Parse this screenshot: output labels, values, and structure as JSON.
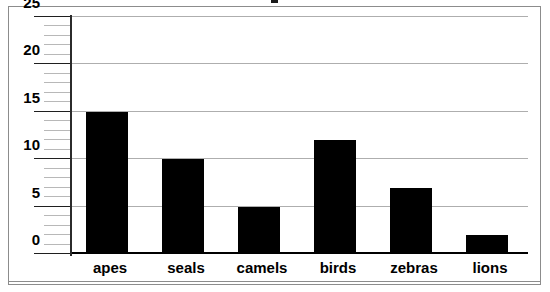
{
  "chart_data": {
    "type": "bar",
    "title": "",
    "xlabel": "",
    "ylabel": "",
    "categories": [
      "apes",
      "seals",
      "camels",
      "birds",
      "zebras",
      "lions"
    ],
    "values": [
      15,
      10,
      5,
      12,
      7,
      2
    ],
    "series": [
      {
        "name": "count",
        "values": [
          15,
          10,
          5,
          12,
          7,
          2
        ]
      }
    ],
    "ylim": [
      0,
      25
    ],
    "xlim_note": "categorical",
    "y_major_ticks": [
      0,
      5,
      10,
      15,
      20,
      25
    ],
    "y_major_tick_labels": [
      "0",
      "5",
      "10",
      "15",
      "20",
      "25"
    ],
    "y_minor_tick_interval": 1,
    "grid": "horizontal-major-only",
    "legend": "none",
    "bar_color": "#000000",
    "gridline_color": "#aeaeae",
    "axis_color": "#2b2b2b",
    "background_color": "#ffffff",
    "frame_color": "#8c8c8c"
  },
  "axes": {
    "y_tick_labels": [
      "25",
      "20",
      "15",
      "10",
      "5",
      "0"
    ]
  }
}
